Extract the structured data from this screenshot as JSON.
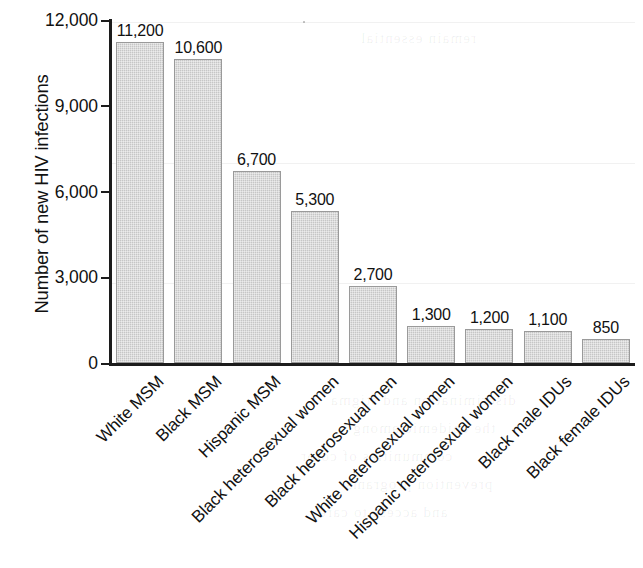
{
  "chart_data": {
    "type": "bar",
    "title": "",
    "xlabel": "",
    "ylabel": "Number of new HIV infections",
    "ylim": [
      0,
      12000
    ],
    "yticks": [
      "0",
      "3,000",
      "6,000",
      "9,000",
      "12,000"
    ],
    "ytick_values": [
      0,
      3000,
      6000,
      9000,
      12000
    ],
    "grid": false,
    "legend": "none",
    "bar_color": "#c6c6c6",
    "bar_edge_color": "#9a9a9a",
    "axis_color": "#1c1c1c",
    "categories": [
      "White MSM",
      "Black MSM",
      "Hispanic MSM",
      "Black heterosexual women",
      "Black heterosexual men",
      "White heterosexual women",
      "Hispanic heterosexual women",
      "Black male IDUs",
      "Black female IDUs"
    ],
    "values": [
      11200,
      10600,
      6700,
      5300,
      2700,
      1300,
      1200,
      1100,
      850
    ],
    "value_labels": [
      "11,200",
      "10,600",
      "6,700",
      "5,300",
      "2,700",
      "1,300",
      "1,200",
      "1,100",
      "850"
    ]
  },
  "artifacts": {
    "bleed_lines": [
      "discrimination and stigma",
      "the epidemic among",
      "communities of color",
      "prevention programs",
      "and access to care",
      "remain essential"
    ]
  }
}
